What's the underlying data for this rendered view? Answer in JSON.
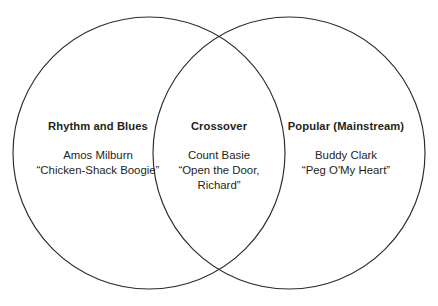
{
  "diagram": {
    "type": "venn-2-set",
    "stroke_color": "#2b2b2b",
    "background_color": "#ffffff",
    "text_color": "#231f20",
    "circles": [
      {
        "name": "left-circle",
        "cx": 149,
        "cy": 153,
        "r": 136
      },
      {
        "name": "right-circle",
        "cx": 289,
        "cy": 153,
        "r": 136
      }
    ],
    "regions": {
      "left": {
        "title": "Rhythm and Blues",
        "body": [
          "Amos Milburn",
          "“Chicken-Shack Boogie”"
        ]
      },
      "center": {
        "title": "Crossover",
        "body": [
          "Count Basie",
          "“Open the Door,",
          "Richard”"
        ]
      },
      "right": {
        "title": "Popular (Mainstream)",
        "body": [
          "Buddy Clark",
          "“Peg O'My Heart”"
        ]
      }
    }
  }
}
